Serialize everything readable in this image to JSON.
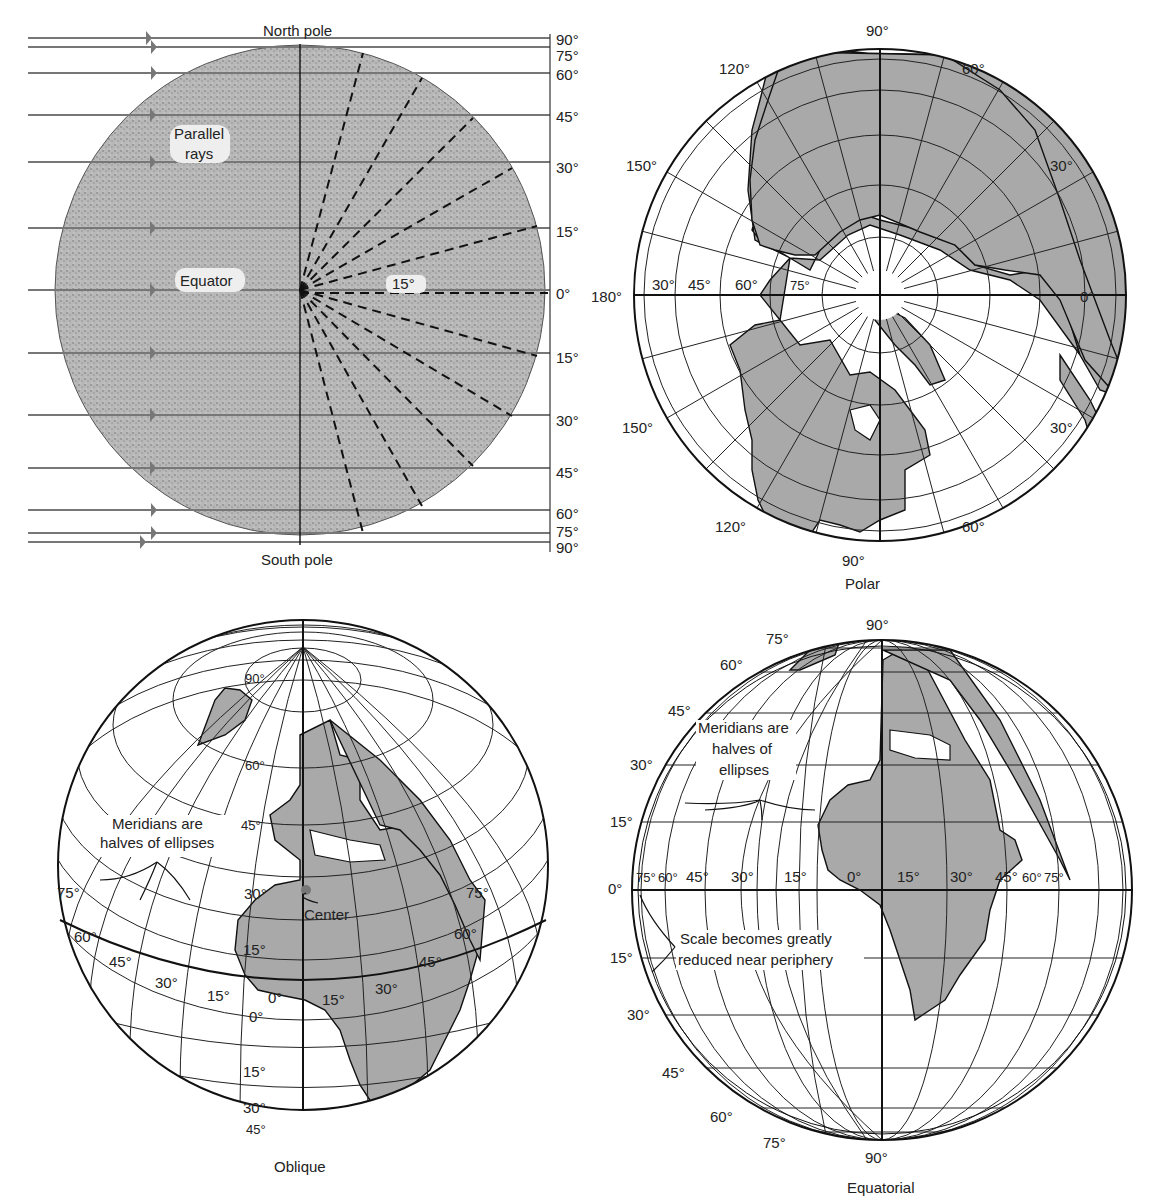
{
  "panels": {
    "rays": {
      "name": "Orthographic principle diagram",
      "top_label": "North pole",
      "bottom_label": "South pole",
      "annotation_parallel": [
        "Parallel",
        "rays"
      ],
      "annotation_equator": "Equator",
      "angle_label": "15°",
      "scale_labels_north": [
        "90°",
        "75°",
        "60°",
        "45°",
        "30°",
        "15°"
      ],
      "zero_label": "0°",
      "scale_labels_south": [
        "15°",
        "30°",
        "45°",
        "60°",
        "75°",
        "90°"
      ]
    },
    "polar": {
      "caption": "Polar",
      "meridian_labels": {
        "top": "90°",
        "top_left": "120°",
        "top_right": "60°",
        "upper_left": "150°",
        "upper_right": "30°",
        "left": "180°",
        "right": "0°",
        "lower_left": "150°",
        "lower_right": "30°",
        "bottom_left": "120°",
        "bottom_right": "60°",
        "bottom": "90°"
      },
      "parallel_labels": [
        "30°",
        "45°",
        "60°",
        "75°"
      ]
    },
    "oblique": {
      "caption": "Oblique",
      "annotation": [
        "Meridians are",
        "halves of ellipses"
      ],
      "center_label": "Center",
      "parallel_labels": [
        "90°",
        "60°",
        "45°",
        "30°",
        "15°",
        "0°",
        "15°",
        "30°",
        "45°"
      ],
      "meridian_labels_left": [
        "75°",
        "60°",
        "45°",
        "30°",
        "15°"
      ],
      "meridian_center": "0°",
      "meridian_labels_right": [
        "15°",
        "30°",
        "45°",
        "60°",
        "75°"
      ]
    },
    "equatorial": {
      "caption": "Equatorial",
      "annotation_meridians": [
        "Meridians are",
        "halves of",
        "ellipses"
      ],
      "annotation_scale": [
        "Scale becomes greatly",
        "reduced near periphery"
      ],
      "top_label": "90°",
      "bottom_label": "90°",
      "parallel_labels_north": [
        "75°",
        "60°",
        "45°",
        "30°",
        "15°"
      ],
      "equator_label": "0°",
      "parallel_labels_south": [
        "15°",
        "30°",
        "45°",
        "60°",
        "75°"
      ],
      "meridian_labels": [
        "75°",
        "60°",
        "45°",
        "30°",
        "15°",
        "0°",
        "15°",
        "30°",
        "45°",
        "60°",
        "75°"
      ]
    }
  }
}
